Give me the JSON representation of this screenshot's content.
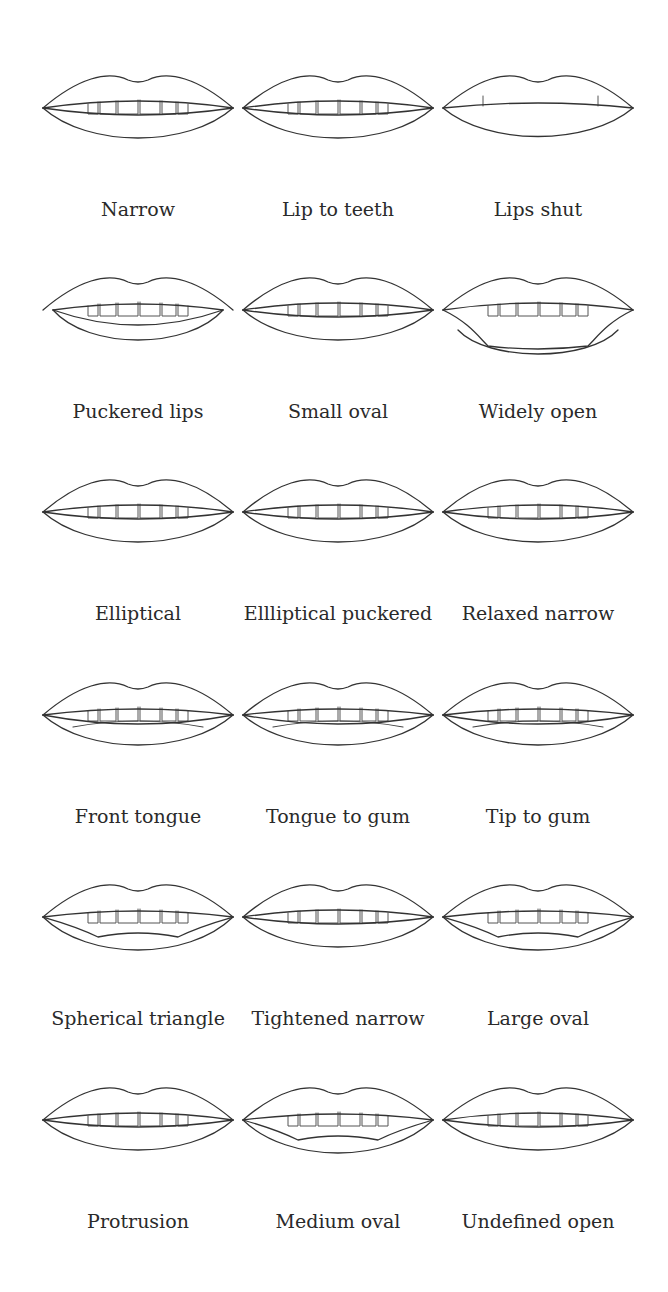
{
  "shapes": [
    {
      "label": "Narrow",
      "variant": "narrow"
    },
    {
      "label": "Lip to teeth",
      "variant": "narrow"
    },
    {
      "label": "Lips shut",
      "variant": "shut"
    },
    {
      "label": "Puckered lips",
      "variant": "pucker"
    },
    {
      "label": "Small oval",
      "variant": "narrow"
    },
    {
      "label": "Widely open",
      "variant": "wide"
    },
    {
      "label": "Elliptical",
      "variant": "narrow"
    },
    {
      "label": "Ellliptical puckered",
      "variant": "narrow"
    },
    {
      "label": "Relaxed narrow",
      "variant": "narrow"
    },
    {
      "label": "Front tongue",
      "variant": "tongue"
    },
    {
      "label": "Tongue to gum",
      "variant": "tongue"
    },
    {
      "label": "Tip to gum",
      "variant": "tongue"
    },
    {
      "label": "Spherical triangle",
      "variant": "open"
    },
    {
      "label": "Tightened narrow",
      "variant": "narrow"
    },
    {
      "label": "Large oval",
      "variant": "open"
    },
    {
      "label": "Protrusion",
      "variant": "narrow"
    },
    {
      "label": "Medium oval",
      "variant": "open"
    },
    {
      "label": "Undefined open",
      "variant": "narrow"
    }
  ],
  "icons": {
    "lip-drawing": "line-art mouth illustration"
  }
}
